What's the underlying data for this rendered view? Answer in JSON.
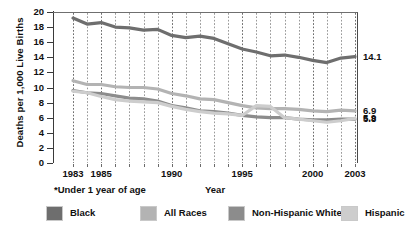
{
  "chart_data": {
    "type": "line",
    "title": "",
    "xlabel": "Year",
    "ylabel": "Deaths per 1,000 Live Births",
    "footnote": "*Under 1 year of age",
    "xlim": [
      1983,
      2003
    ],
    "ylim": [
      0,
      20
    ],
    "ytick_step": 2,
    "yticks": [
      "20",
      "18",
      "16",
      "14",
      "12",
      "10",
      "8",
      "6",
      "4",
      "2",
      "0"
    ],
    "xticks": [
      "1983",
      "1985",
      "1990",
      "1995",
      "2000",
      "2003"
    ],
    "xtick_years": [
      1983,
      1985,
      1990,
      1995,
      2000,
      2003
    ],
    "grid": "vertical-dotted-every-year",
    "legend_position": "bottom",
    "x": [
      1983,
      1984,
      1985,
      1986,
      1987,
      1988,
      1989,
      1990,
      1991,
      1992,
      1993,
      1994,
      1995,
      1996,
      1997,
      1998,
      1999,
      2000,
      2001,
      2002,
      2003
    ],
    "series": [
      {
        "name": "Black",
        "color": "#6e6e6e",
        "end_label": "14.1",
        "values": [
          19.2,
          18.4,
          18.6,
          18.0,
          17.9,
          17.6,
          17.7,
          16.9,
          16.6,
          16.8,
          16.5,
          15.8,
          15.1,
          14.7,
          14.2,
          14.3,
          14.0,
          13.6,
          13.3,
          13.9,
          14.1
        ]
      },
      {
        "name": "All Races",
        "color": "#b3b3b3",
        "end_label": "6.9",
        "values": [
          10.9,
          10.4,
          10.4,
          10.1,
          10.0,
          10.0,
          9.8,
          9.2,
          8.9,
          8.5,
          8.4,
          8.0,
          7.6,
          7.3,
          7.2,
          7.2,
          7.1,
          6.9,
          6.8,
          7.0,
          6.9
        ]
      },
      {
        "name": "Non-Hispanic White",
        "color": "#8c8c8c",
        "end_label": "5.8",
        "values": [
          9.6,
          9.3,
          9.2,
          8.9,
          8.6,
          8.5,
          8.2,
          7.6,
          7.3,
          6.9,
          6.8,
          6.6,
          6.3,
          6.1,
          6.0,
          6.0,
          5.8,
          5.7,
          5.7,
          5.8,
          5.8
        ]
      },
      {
        "name": "Hispanic",
        "color": "#cdcdcd",
        "end_label": "5.9",
        "values": [
          9.5,
          9.3,
          8.8,
          8.4,
          8.2,
          8.1,
          8.0,
          7.5,
          7.1,
          6.8,
          6.6,
          6.5,
          6.3,
          7.6,
          7.5,
          6.0,
          5.8,
          5.6,
          5.4,
          5.6,
          5.9
        ]
      }
    ],
    "end_labels": [
      {
        "text": "14.1",
        "value": 14.1
      },
      {
        "text": "6.9",
        "value": 6.9
      },
      {
        "text": "5.9",
        "value": 5.9
      },
      {
        "text": "5.8",
        "value": 5.8
      }
    ],
    "legend": [
      {
        "label": "Black",
        "color": "#6e6e6e"
      },
      {
        "label": "All Races",
        "color": "#b3b3b3"
      },
      {
        "label": "Non-Hispanic White",
        "color": "#8c8c8c"
      },
      {
        "label": "Hispanic",
        "color": "#cdcdcd"
      }
    ]
  }
}
